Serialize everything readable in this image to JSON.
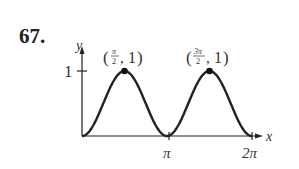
{
  "problem_number": "67.",
  "chart_data": {
    "type": "line",
    "title": "",
    "function": "y = sin^2(x)",
    "xlabel": "x",
    "ylabel": "y",
    "x_ticks": [
      "π",
      "2π"
    ],
    "y_ticks": [
      "1"
    ],
    "xlim": [
      0,
      6.2832
    ],
    "ylim": [
      0,
      1
    ],
    "grid": false,
    "legend": null,
    "series": [
      {
        "name": "sin^2(x)",
        "x": [
          0,
          0.7854,
          1.5708,
          2.3562,
          3.1416,
          3.927,
          4.7124,
          5.4978,
          6.2832
        ],
        "values": [
          0,
          0.5,
          1,
          0.5,
          0,
          0.5,
          1,
          0.5,
          0
        ]
      }
    ],
    "annotations": [
      {
        "label_num": "π",
        "label_den": "2",
        "label_y": "1",
        "x": 1.5708,
        "y": 1,
        "text": "(π/2, 1)"
      },
      {
        "label_num": "3π",
        "label_den": "2",
        "label_y": "1",
        "x": 4.7124,
        "y": 1,
        "text": "(3π/2, 1)"
      }
    ]
  }
}
